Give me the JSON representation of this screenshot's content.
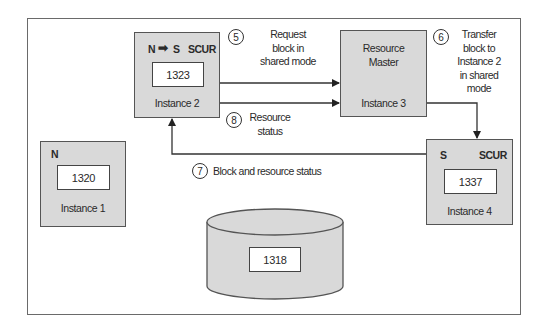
{
  "diagram": {
    "instances": [
      {
        "id": "instance-1",
        "name": "Instance 1",
        "mode": "N",
        "lock": "",
        "block": "1320"
      },
      {
        "id": "instance-2",
        "name": "Instance 2",
        "mode": "N → S",
        "mode_from": "N",
        "mode_to": "S",
        "lock": "SCUR",
        "block": "1323"
      },
      {
        "id": "instance-3",
        "name": "Instance 3",
        "role": "Resource Master"
      },
      {
        "id": "instance-4",
        "name": "Instance 4",
        "mode": "S",
        "lock": "SCUR",
        "block": "1337"
      }
    ],
    "disk": {
      "block": "1318"
    },
    "steps": [
      {
        "number": "5",
        "lines": [
          "Request",
          "block in",
          "shared mode"
        ],
        "from": "Instance 2",
        "to": "Instance 3"
      },
      {
        "number": "6",
        "lines": [
          "Transfer",
          "block to",
          "Instance 2",
          "in shared",
          "mode"
        ],
        "from": "Instance 3",
        "to": "Instance 4"
      },
      {
        "number": "7",
        "lines": [
          "Block and resource status"
        ],
        "from": "Instance 4",
        "to": "Instance 2"
      },
      {
        "number": "8",
        "lines": [
          "Resource",
          "status"
        ],
        "from": "Instance 2",
        "to": "Instance 3"
      }
    ],
    "colors": {
      "box_fill": "#d9d9d9",
      "border": "#555555",
      "line": "#333333",
      "background": "#ffffff"
    }
  }
}
